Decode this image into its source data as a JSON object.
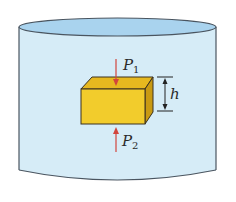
{
  "diagram": {
    "labels": {
      "p1": {
        "symbol": "P",
        "subscript": "1"
      },
      "p2": {
        "symbol": "P",
        "subscript": "2"
      },
      "h": "h"
    },
    "colors": {
      "liquid": "#d6ecf7",
      "liquid_surface": "#a9d3ee",
      "container_outline": "#4a5560",
      "block_front": "#f2cc2c",
      "block_top": "#e6b81f",
      "block_side": "#c99a12",
      "block_outline": "#3a3020",
      "arrow": "#d2453c",
      "dimension_line": "#222222"
    }
  }
}
